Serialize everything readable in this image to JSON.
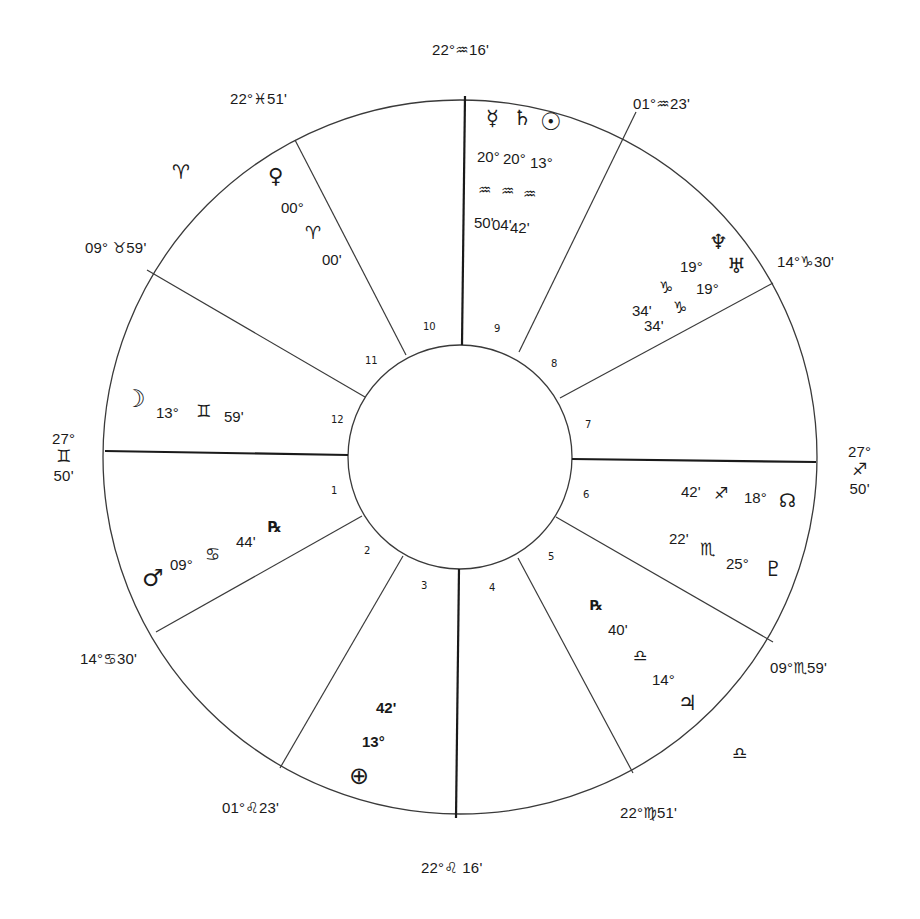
{
  "chart": {
    "type": "natal-wheel",
    "center": [
      460,
      457
    ],
    "outer_radius": 357,
    "inner_radius": 112,
    "line_color": "#2a2a2a"
  },
  "house_numbers": [
    "1",
    "2",
    "3",
    "4",
    "5",
    "6",
    "7",
    "8",
    "9",
    "10",
    "11",
    "12"
  ],
  "cusps": {
    "mc": {
      "deg": "22°",
      "sign": "♒",
      "min": "16'"
    },
    "c11": {
      "deg": "22°",
      "sign": "♓",
      "min": "51'"
    },
    "c12": {
      "deg": "09°",
      "sign": "♉",
      "min": "59'"
    },
    "asc": {
      "deg": "27°",
      "sign": "♊",
      "min": "50'"
    },
    "c2": {
      "deg": "14°",
      "sign": "♋",
      "min": "30'"
    },
    "c3": {
      "deg": "01°",
      "sign": "♌",
      "min": "23'"
    },
    "ic": {
      "deg": "22°",
      "sign": "♌",
      "min": "16'"
    },
    "c5": {
      "deg": "22°",
      "sign": "♍",
      "min": "51'"
    },
    "c6": {
      "deg": "09°",
      "sign": "♏",
      "min": "59'"
    },
    "dsc": {
      "deg": "27°",
      "sign": "♐",
      "min": "50'"
    },
    "c8": {
      "deg": "14°",
      "sign": "♑",
      "min": "30'"
    },
    "c9": {
      "deg": "01°",
      "sign": "♒",
      "min": "23'"
    }
  },
  "intercepted": {
    "aries": "♈",
    "libra": "♎"
  },
  "planets": {
    "mercury": {
      "glyph": "☿",
      "deg": "20°",
      "sign": "♒",
      "min": "50'"
    },
    "saturn": {
      "glyph": "♄",
      "deg": "20°",
      "sign": "♒",
      "min": "04'"
    },
    "sun": {
      "glyph": "☉",
      "deg": "13°",
      "sign": "♒",
      "min": "42'"
    },
    "neptune": {
      "glyph": "♆",
      "deg": "19°",
      "sign": "♑",
      "min": "34'"
    },
    "uranus": {
      "glyph": "♅",
      "deg": "19°",
      "sign": "♑",
      "min": "34'"
    },
    "venus": {
      "glyph": "♀",
      "deg": "00°",
      "sign": "♈",
      "min": "00'"
    },
    "moon": {
      "glyph": "☽",
      "deg": "13°",
      "sign": "♊",
      "min": "59'"
    },
    "mars": {
      "glyph": "♂",
      "deg": "09°",
      "sign": "♋",
      "min": "44'",
      "retro": "℞"
    },
    "node": {
      "glyph": "☊",
      "deg": "18°",
      "sign": "♐",
      "min": "42'"
    },
    "pluto": {
      "glyph": "♇",
      "deg": "25°",
      "sign": "♏",
      "min": "22'"
    },
    "jupiter": {
      "glyph": "♃",
      "deg": "14°",
      "sign": "♎",
      "min": "40'",
      "retro": "℞"
    },
    "earth": {
      "glyph": "⊕",
      "deg": "13°",
      "min": "42'"
    }
  }
}
